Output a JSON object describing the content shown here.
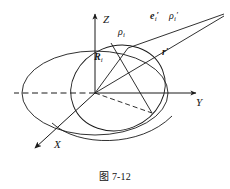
{
  "figure": {
    "caption_prefix": "图",
    "caption_number": "7-12",
    "caption_full": "图 7-12",
    "background_color": "#ffffff",
    "stroke_color": "#1a1a1a"
  },
  "axes": {
    "z": {
      "label": "Z",
      "name": "z-axis",
      "direction": "up"
    },
    "y": {
      "label": "Y",
      "name": "y-axis",
      "direction": "right"
    },
    "x": {
      "label": "X",
      "name": "x-axis",
      "direction": "down-left"
    },
    "origin_label": ""
  },
  "vectors": {
    "big_r": {
      "symbol": "R",
      "subscript": "i",
      "prime": "",
      "bold": true
    },
    "rho_i": {
      "symbol": "ρ",
      "subscript": "i",
      "prime": "",
      "bold": false
    },
    "e_i_prime": {
      "symbol": "e",
      "subscript": "i",
      "prime": "′",
      "bold": true
    },
    "rho_i_prime": {
      "symbol": "ρ",
      "subscript": "i",
      "prime": "′",
      "bold": false
    },
    "r_prime": {
      "symbol": "r",
      "subscript": "",
      "prime": "′",
      "bold": true
    }
  },
  "shapes": {
    "horizontal_ellipse": "large flat ellipse centered at origin in XY plane",
    "tilted_ellipse": "second ellipse inclined, intersecting the horizontal one",
    "dashed_segments": [
      "y-axis negative extension",
      "origin to lower-right intersection point"
    ]
  }
}
